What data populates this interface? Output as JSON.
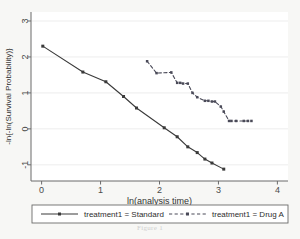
{
  "figure": {
    "caption": "Figure 1",
    "background_color": "#f7f7f5",
    "plot_background_color": "#ffffff",
    "axis_color": "#6b6b6b",
    "grid_color": "#e8e8e8",
    "series_color_standard": "#3a3a3a",
    "series_color_druga": "#4a4a58"
  },
  "chart_data": {
    "type": "line",
    "title": "",
    "subtitle": "",
    "xlabel": "ln(analysis time)",
    "ylabel": "-ln{-ln(Survival Probability)}",
    "xlim": [
      -0.18,
      4.18
    ],
    "ylim": [
      -1.45,
      3.25
    ],
    "xticks": [
      0,
      1,
      2,
      3,
      4
    ],
    "xticklabels": [
      "0",
      "1",
      "2",
      "3",
      "4"
    ],
    "yticks": [
      -1,
      0,
      1,
      2,
      3
    ],
    "yticklabels": [
      "-1",
      "0",
      "1",
      "2",
      "3"
    ],
    "grid": "horizontal",
    "legend_position": "bottom",
    "series": [
      {
        "name": "treatment1 = Standard",
        "linestyle": "solid",
        "marker": "square",
        "color": "#3a3a3a",
        "x": [
          0.02,
          0.7,
          1.09,
          1.39,
          1.61,
          2.08,
          2.3,
          2.48,
          2.64,
          2.77,
          2.89,
          3.09
        ],
        "y": [
          2.3,
          1.58,
          1.31,
          0.9,
          0.58,
          0.03,
          -0.22,
          -0.5,
          -0.66,
          -0.84,
          -0.95,
          -1.12
        ]
      },
      {
        "name": "treatment1 = Drug A",
        "linestyle": "dashed",
        "marker": "square",
        "color": "#4a4a58",
        "x": [
          1.79,
          1.95,
          2.2,
          2.3,
          2.35,
          2.4,
          2.48,
          2.56,
          2.64,
          2.77,
          2.83,
          2.89,
          2.94,
          3.04,
          3.09,
          3.18,
          3.22,
          3.3,
          3.43,
          3.5,
          3.56
        ],
        "y": [
          1.88,
          1.55,
          1.57,
          1.28,
          1.28,
          1.26,
          1.26,
          1.0,
          0.88,
          0.78,
          0.78,
          0.76,
          0.76,
          0.62,
          0.48,
          0.22,
          0.22,
          0.22,
          0.22,
          0.22,
          0.22
        ]
      }
    ],
    "legend": [
      {
        "label": "treatment1 = Standard",
        "linestyle": "solid",
        "marker": "square",
        "color": "#3a3a3a"
      },
      {
        "label": "treatment1 = Drug A",
        "linestyle": "dashed",
        "marker": "square",
        "color": "#4a4a58"
      }
    ]
  }
}
